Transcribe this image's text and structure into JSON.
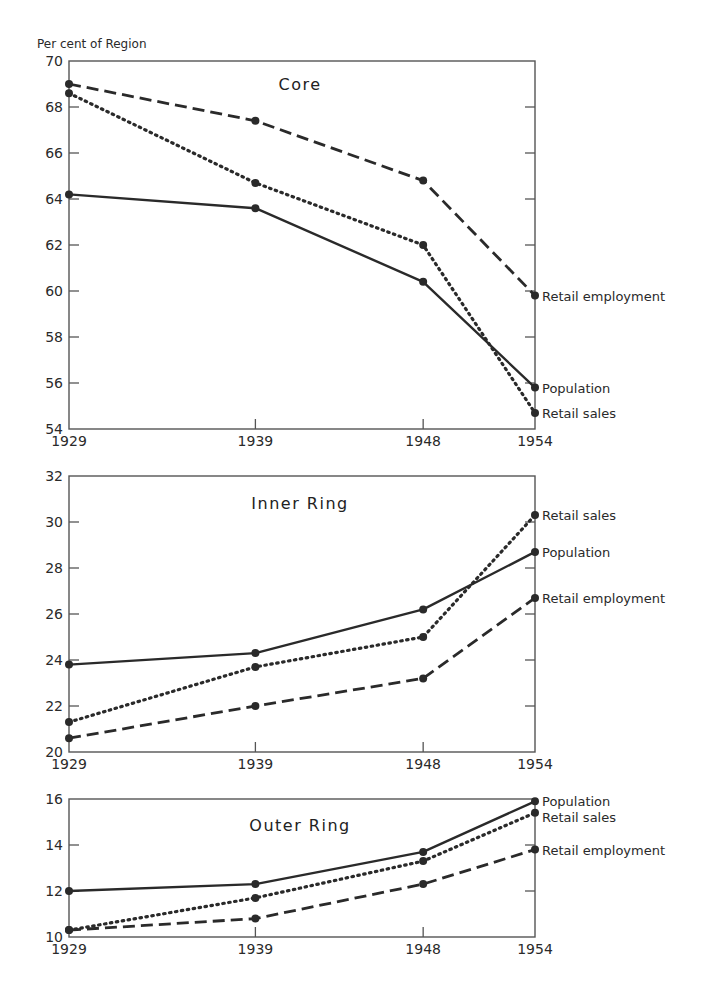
{
  "chart_data": [
    {
      "type": "line",
      "title": "Core",
      "ylabel": "Per cent of Region",
      "xlabel": "",
      "x": [
        1929,
        1939,
        1948,
        1954
      ],
      "x_tick_labels": [
        "1929",
        "1939",
        "1948",
        "1954"
      ],
      "ylim": [
        54,
        70
      ],
      "y_ticks": [
        54,
        56,
        58,
        60,
        62,
        64,
        66,
        68,
        70
      ],
      "grid": false,
      "legend_position": "inline-right",
      "series": [
        {
          "name": "Retail employment",
          "style": "dashed",
          "values": [
            69.0,
            67.4,
            64.8,
            59.8
          ]
        },
        {
          "name": "Population",
          "style": "solid",
          "values": [
            64.2,
            63.6,
            60.4,
            55.8
          ]
        },
        {
          "name": "Retail sales",
          "style": "dotted",
          "values": [
            68.6,
            64.7,
            62.0,
            54.7
          ]
        }
      ]
    },
    {
      "type": "line",
      "title": "Inner Ring",
      "ylabel": "",
      "xlabel": "",
      "x": [
        1929,
        1939,
        1948,
        1954
      ],
      "x_tick_labels": [
        "1929",
        "1939",
        "1948",
        "1954"
      ],
      "ylim": [
        20,
        32
      ],
      "y_ticks": [
        20,
        22,
        24,
        26,
        28,
        30,
        32
      ],
      "grid": false,
      "legend_position": "inline-right",
      "series": [
        {
          "name": "Retail sales",
          "style": "dotted",
          "values": [
            21.3,
            23.7,
            25.0,
            30.3
          ]
        },
        {
          "name": "Population",
          "style": "solid",
          "values": [
            23.8,
            24.3,
            26.2,
            28.7
          ]
        },
        {
          "name": "Retail employment",
          "style": "dashed",
          "values": [
            20.6,
            22.0,
            23.2,
            26.7
          ]
        }
      ]
    },
    {
      "type": "line",
      "title": "Outer Ring",
      "ylabel": "",
      "xlabel": "",
      "x": [
        1929,
        1939,
        1948,
        1954
      ],
      "x_tick_labels": [
        "1929",
        "1939",
        "1948",
        "1954"
      ],
      "ylim": [
        10,
        16
      ],
      "y_ticks": [
        10,
        12,
        14,
        16
      ],
      "grid": false,
      "legend_position": "inline-right",
      "series": [
        {
          "name": "Population",
          "style": "solid",
          "values": [
            12.0,
            12.3,
            13.7,
            15.9
          ]
        },
        {
          "name": "Retail sales",
          "style": "dotted",
          "values": [
            10.3,
            11.7,
            13.3,
            15.4
          ]
        },
        {
          "name": "Retail employment",
          "style": "dashed",
          "values": [
            10.3,
            10.8,
            12.3,
            13.8
          ]
        }
      ]
    }
  ],
  "colors": {
    "ink": "#2a2a2a",
    "axis": "#555555",
    "background": "#ffffff"
  }
}
